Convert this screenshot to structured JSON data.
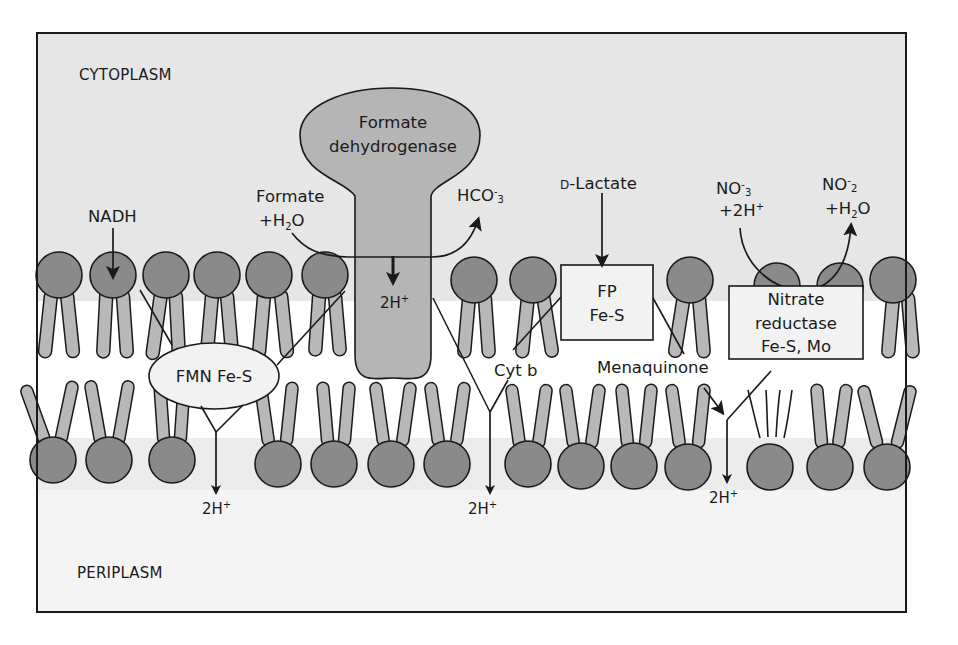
{
  "regions": {
    "top": "CYTOPLASM",
    "bottom": "PERIPLASM"
  },
  "colors": {
    "cytoplasm_bg": "#e6e6e6",
    "membrane_core_bg": "#ffffff",
    "periplasm_bg": "#f3f3f3",
    "lipid_head": "#8a8a8a",
    "lipid_tail": "#b8b8b8",
    "enzyme_fill": "#b5b5b5",
    "protein_box_fill": "#f2f2f2",
    "stroke": "#1a1a1a"
  },
  "substrates": {
    "nadh": "NADH",
    "formate_line1": "Formate",
    "formate_line2_plus": "+H",
    "formate_line2_sub": "2",
    "formate_line2_end": "O",
    "bicarbonate_main": "HCO",
    "bicarbonate_sup": "-",
    "bicarbonate_sub": "3",
    "lactate_smallcap": "D",
    "lactate_rest": "-Lactate",
    "nitrate_main": "NO",
    "nitrate_sup": "-",
    "nitrate_sub": "3",
    "nitrate_line2": "+2H",
    "nitrate_line2_sup": "+",
    "nitrite_main": "NO",
    "nitrite_sup": "-",
    "nitrite_sub": "2",
    "nitrite_line2_plus": "+H",
    "nitrite_line2_sub": "2",
    "nitrite_line2_end": "O"
  },
  "proteins": {
    "formate_dehydrogenase_line1": "Formate",
    "formate_dehydrogenase_line2": "dehydrogenase",
    "formate_dehydrogenase_proton": "2H",
    "formate_dehydrogenase_proton_sup": "+",
    "nadh_dehydrogenase": "FMN Fe-S",
    "lactate_dehydrogenase_line1": "FP",
    "lactate_dehydrogenase_line2": "Fe-S",
    "nitrate_reductase_line1": "Nitrate",
    "nitrate_reductase_line2": "reductase",
    "nitrate_reductase_line3": "Fe-S, Mo",
    "cytochrome": "Cyt b",
    "quinone": "Menaquinone"
  },
  "proton_outputs": [
    {
      "label": "2H",
      "sup": "+"
    },
    {
      "label": "2H",
      "sup": "+"
    },
    {
      "label": "2H",
      "sup": "+"
    }
  ]
}
